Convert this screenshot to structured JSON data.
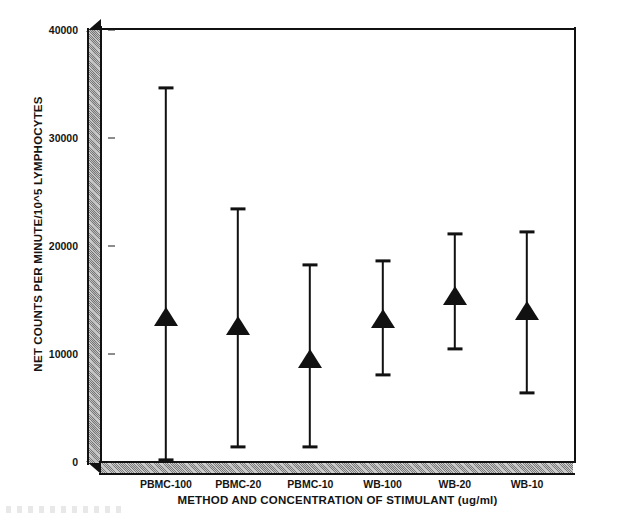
{
  "chart_data": {
    "type": "scatter",
    "title": "",
    "xlabel": "METHOD AND CONCENTRATION OF STIMULANT (ug/ml)",
    "ylabel": "NET COUNTS PER MINUTE/10^5 LYMPHOCYTES",
    "categories": [
      "PBMC-100",
      "PBMC-20",
      "PBMC-10",
      "WB-100",
      "WB-20",
      "WB-10"
    ],
    "values": [
      13350,
      12500,
      9450,
      13150,
      15300,
      13900
    ],
    "error_upper": [
      34600,
      23400,
      18200,
      18600,
      21100,
      21300
    ],
    "error_lower": [
      200,
      1400,
      1400,
      8050,
      10450,
      6400
    ],
    "ylim": [
      0,
      40000
    ],
    "yticks": [
      0,
      10000,
      20000,
      30000,
      40000
    ],
    "ytick_labels": [
      "0",
      "10000",
      "20000",
      "30000",
      "40000"
    ],
    "grid": false,
    "legend": "none",
    "marker": "triangle-up",
    "marker_color": "#111111",
    "errorbar_color": "#111111",
    "points": [
      {
        "category": "PBMC-100",
        "mean": 13350,
        "upper": 34600,
        "lower": 200
      },
      {
        "category": "PBMC-20",
        "mean": 12500,
        "upper": 23400,
        "lower": 1400
      },
      {
        "category": "PBMC-10",
        "mean": 9450,
        "upper": 18200,
        "lower": 1400
      },
      {
        "category": "WB-100",
        "mean": 13150,
        "upper": 18600,
        "lower": 8050
      },
      {
        "category": "WB-20",
        "mean": 15300,
        "upper": 21100,
        "lower": 10450
      },
      {
        "category": "WB-10",
        "mean": 13900,
        "upper": 21300,
        "lower": 6400
      }
    ]
  },
  "figure": {
    "background_color": "#ffffff",
    "axis_color": "#111111",
    "wall_fill_color": "#c6c6c6"
  }
}
